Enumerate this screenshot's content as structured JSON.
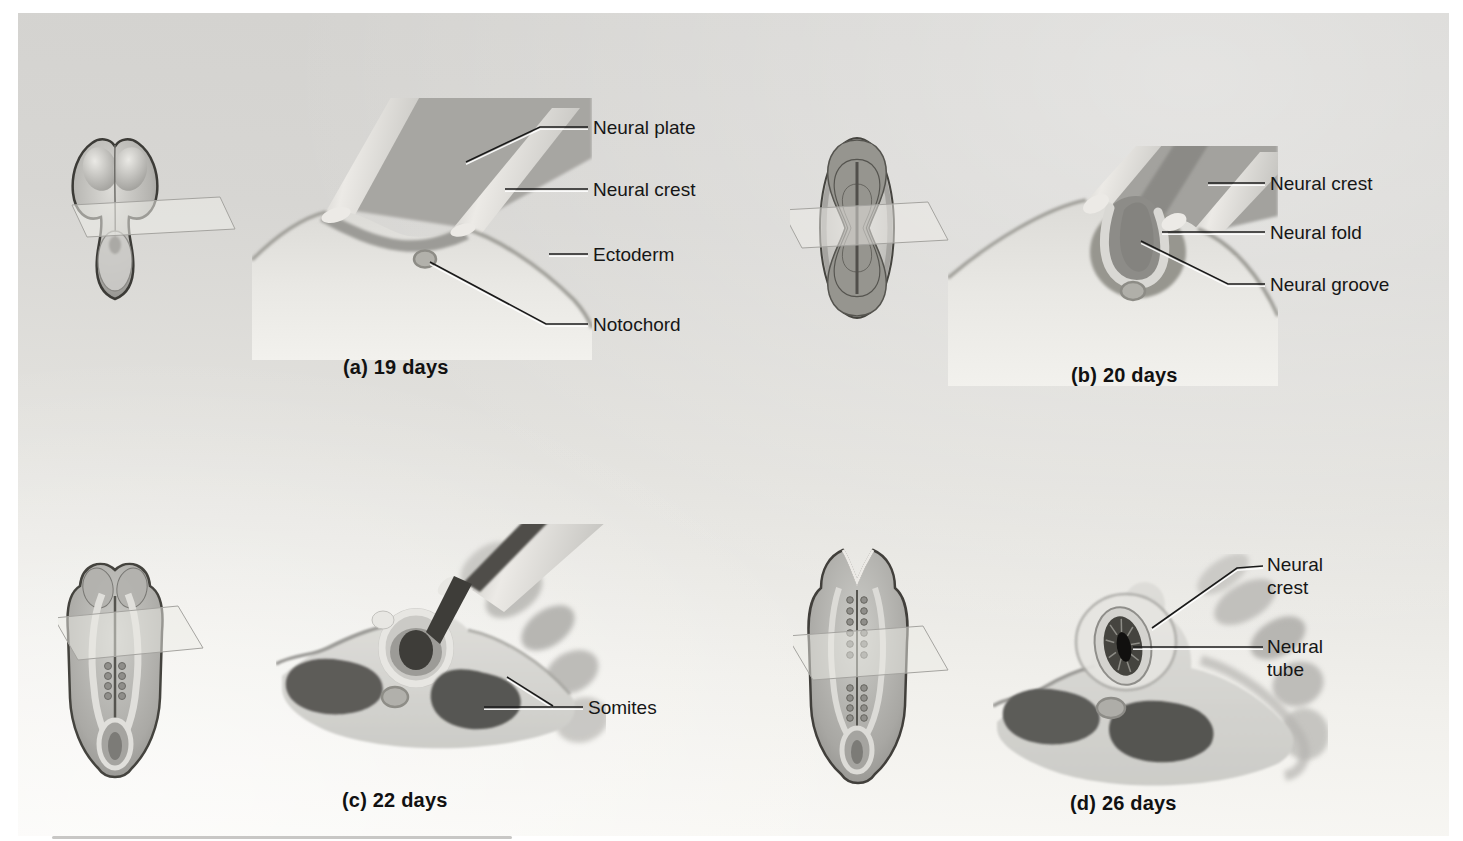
{
  "figure": {
    "panels": [
      {
        "caption": "(a) 19 days",
        "labels": [
          "Neural plate",
          "Neural crest",
          "Ectoderm",
          "Notochord"
        ]
      },
      {
        "caption": "(b) 20 days",
        "labels": [
          "Neural crest",
          "Neural fold",
          "Neural groove"
        ]
      },
      {
        "caption": "(c) 22 days",
        "labels": [
          "Somites"
        ]
      },
      {
        "caption": "(d) 26 days",
        "labels": [
          "Neural crest",
          "Neural tube"
        ]
      }
    ],
    "colors": {
      "figure_background_top": "#d5d4d1",
      "figure_background_bottom": "#f8f7f4",
      "label_text": "#161616",
      "leader_line": "#1a1a1a",
      "somite_dark": "#5c5b58",
      "tissue_light": "#e8e7e3",
      "tissue_shadow": "#9c9b97",
      "groove_dark": "#3e3d39"
    }
  }
}
